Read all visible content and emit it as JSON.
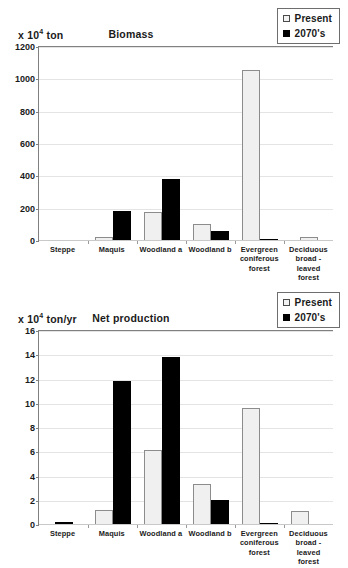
{
  "legend": {
    "position": "top-right",
    "entries": [
      {
        "label": "Present",
        "swatch": "white-square-icon",
        "color": "#F0F0F0"
      },
      {
        "label": "2070's",
        "swatch": "black-square-icon",
        "color": "#000000"
      }
    ]
  },
  "charts": [
    {
      "id": "biomass",
      "unit_prefix": "x 10",
      "unit_exponent": "4",
      "unit_suffix": " ton",
      "title": "Biomass",
      "yticks": [
        "1200",
        "1000",
        "800",
        "600",
        "400",
        "200",
        "0"
      ],
      "categories": [
        "Steppe",
        "Maquis",
        "Woodland a",
        "Woodland b",
        "Evergreen\nconiferous\nforest",
        "Deciduous\nbroad -leaved\nforest"
      ]
    },
    {
      "id": "netprod",
      "unit_prefix": "x 10",
      "unit_exponent": "4",
      "unit_suffix": " ton/yr",
      "title": "Net production",
      "yticks": [
        "16",
        "14",
        "12",
        "10",
        "8",
        "6",
        "4",
        "2",
        "0"
      ],
      "categories": [
        "Steppe",
        "Maquis",
        "Woodland a",
        "Woodland b",
        "Evergreen\nconiferous\nforest",
        "Deciduous\nbroad -leaved\nforest"
      ]
    }
  ],
  "chart_data": [
    {
      "type": "bar",
      "id": "biomass",
      "title": "Biomass",
      "xlabel": "",
      "ylabel": "x 10^4 ton",
      "ylim": [
        0,
        1200
      ],
      "ytick_step": 200,
      "grid": true,
      "legend_position": "top-right",
      "categories": [
        "Steppe",
        "Maquis",
        "Woodland a",
        "Woodland b",
        "Evergreen coniferous forest",
        "Deciduous broad-leaved forest"
      ],
      "series": [
        {
          "name": "Present",
          "color": "#F0F0F0",
          "values": [
            0,
            22,
            180,
            105,
            1055,
            22
          ]
        },
        {
          "name": "2070's",
          "color": "#000000",
          "values": [
            0,
            183,
            382,
            62,
            15,
            0
          ]
        }
      ]
    },
    {
      "type": "bar",
      "id": "netprod",
      "title": "Net production",
      "xlabel": "",
      "ylabel": "x 10^4 ton/yr",
      "ylim": [
        0,
        16
      ],
      "ytick_step": 2,
      "grid": true,
      "legend_position": "top-right",
      "categories": [
        "Steppe",
        "Maquis",
        "Woodland a",
        "Woodland b",
        "Evergreen coniferous forest",
        "Deciduous broad-leaved forest"
      ],
      "series": [
        {
          "name": "Present",
          "color": "#F0F0F0",
          "values": [
            0,
            1.2,
            6.15,
            3.4,
            9.65,
            1.15
          ]
        },
        {
          "name": "2070's",
          "color": "#000000",
          "values": [
            0.25,
            11.85,
            13.85,
            2.05,
            0.15,
            0.1
          ]
        }
      ]
    }
  ]
}
